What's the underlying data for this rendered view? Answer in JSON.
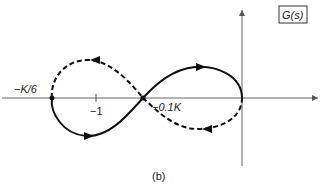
{
  "figure": {
    "caption": "(b)",
    "box_label": "G(s)",
    "labels": {
      "left_intercept": "−K/6",
      "tick_minus_one": "−1",
      "crossing": "−0.1K"
    },
    "colors": {
      "stroke": "#111111",
      "axis": "#555555",
      "background": "#ffffff"
    },
    "curves": [
      {
        "name": "solid-branch",
        "style": "solid",
        "direction": "arrows indicate traversal"
      },
      {
        "name": "dashed-branch",
        "style": "dashed",
        "direction": "arrows indicate traversal"
      }
    ]
  }
}
